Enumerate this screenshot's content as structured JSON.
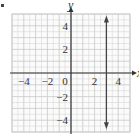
{
  "figure": {
    "marker": "•"
  },
  "chart_data": {
    "type": "line",
    "title": "",
    "xlabel": "x",
    "ylabel": "y",
    "xlim": [
      -5,
      5
    ],
    "ylim": [
      -5,
      5
    ],
    "grid": true,
    "x_ticks": [
      "-4",
      "-2",
      "0",
      "2",
      "4"
    ],
    "y_ticks": [
      "4",
      "2",
      "-2",
      "-4"
    ],
    "series": [
      {
        "name": "x = 3",
        "type": "vertical_line",
        "x": [
          3,
          3
        ],
        "y": [
          -4.6,
          4.7
        ],
        "arrows": "both"
      }
    ],
    "colors": {
      "grid": "#c8c8c8",
      "axes": "#333333",
      "line": "#444444"
    }
  }
}
